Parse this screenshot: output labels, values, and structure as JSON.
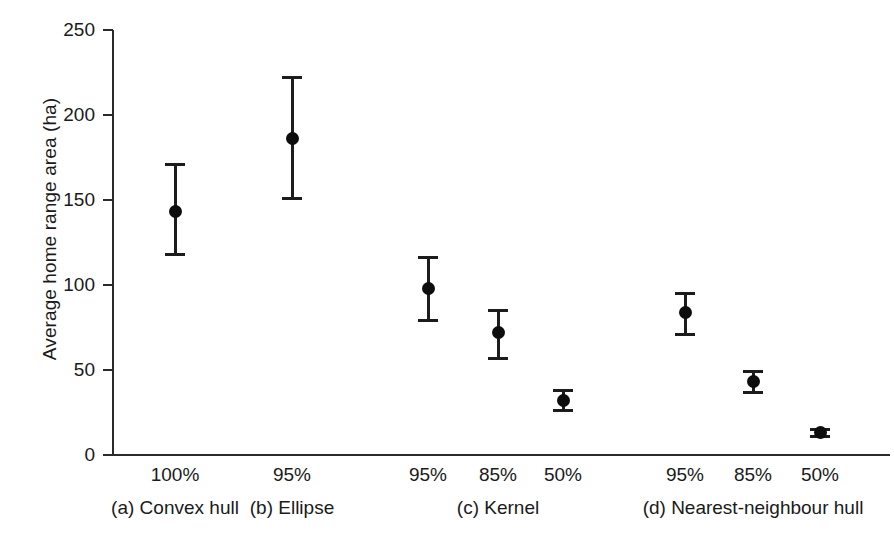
{
  "chart_data": {
    "type": "scatter",
    "title": "",
    "xlabel": "",
    "ylabel": "Average home range area (ha)",
    "ylim": [
      0,
      250
    ],
    "yticks": [
      0,
      50,
      100,
      150,
      200,
      250
    ],
    "ytick_labels": [
      "0",
      "50",
      "100",
      "150",
      "200",
      "250"
    ],
    "grid": false,
    "legend": "none",
    "error_bar_type": "95% confidence interval / SE whiskers",
    "categories": [
      "100%",
      "95%",
      "95%",
      "85%",
      "50%",
      "95%",
      "85%",
      "50%"
    ],
    "values": [
      143,
      186,
      98,
      72,
      32,
      84,
      43,
      13
    ],
    "error_low": [
      118,
      151,
      79,
      57,
      26,
      71,
      37,
      11
    ],
    "error_high": [
      171,
      222,
      116,
      85,
      38,
      95,
      49,
      15
    ],
    "groups": [
      {
        "label": "(a) Convex hull",
        "categories": [
          "100%"
        ]
      },
      {
        "label": "(b) Ellipse",
        "categories": [
          "95%"
        ]
      },
      {
        "label": "(c) Kernel",
        "categories": [
          "95%",
          "85%",
          "50%"
        ]
      },
      {
        "label": "(d) Nearest-neighbour hull",
        "categories": [
          "95%",
          "85%",
          "50%"
        ]
      }
    ],
    "points": [
      {
        "category": "100%",
        "group": "(a) Convex hull",
        "mean": 143,
        "low": 118,
        "high": 171
      },
      {
        "category": "95%",
        "group": "(b) Ellipse",
        "mean": 186,
        "low": 151,
        "high": 222
      },
      {
        "category": "95%",
        "group": "(c) Kernel",
        "mean": 98,
        "low": 79,
        "high": 116
      },
      {
        "category": "85%",
        "group": "(c) Kernel",
        "mean": 72,
        "low": 57,
        "high": 85
      },
      {
        "category": "50%",
        "group": "(c) Kernel",
        "mean": 32,
        "low": 26,
        "high": 38
      },
      {
        "category": "95%",
        "group": "(d) Nearest-neighbour hull",
        "mean": 84,
        "low": 71,
        "high": 95
      },
      {
        "category": "85%",
        "group": "(d) Nearest-neighbour hull",
        "mean": 43,
        "low": 37,
        "high": 49
      },
      {
        "category": "50%",
        "group": "(d) Nearest-neighbour hull",
        "mean": 13,
        "low": 11,
        "high": 15
      }
    ],
    "colors": {
      "marker": "#0d0d0d",
      "error_bar": "#1c1c1c",
      "axis": "#2b2b2b",
      "text": "#1a1a1a",
      "background": "#ffffff"
    }
  },
  "axes": {
    "y_title": "Average home range area (ha)"
  }
}
